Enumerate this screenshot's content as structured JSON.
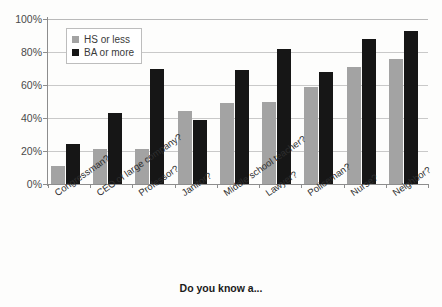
{
  "chart_data": {
    "type": "bar",
    "title": "",
    "subtitle": "",
    "xlabel": "Do you know a...",
    "ylabel": "",
    "ylim": [
      0,
      100
    ],
    "y_unit": "%",
    "grid": true,
    "legend_position": "top-left-inside",
    "categories": [
      "Congressman?",
      "CEO of large company?",
      "Professor?",
      "Janitor?",
      "Middle school teacher?",
      "Lawyer?",
      "Policeman?",
      "Nurse?",
      "Neighbor?"
    ],
    "y_ticks": [
      "0%",
      "20%",
      "40%",
      "60%",
      "80%",
      "100%"
    ],
    "y_tick_values": [
      0,
      20,
      40,
      60,
      80,
      100
    ],
    "series": [
      {
        "name": "HS or less",
        "color": "#a3a3a3",
        "values": [
          11,
          21,
          21,
          44,
          49,
          50,
          59,
          71,
          76
        ]
      },
      {
        "name": "BA or more",
        "color": "#161616",
        "values": [
          24,
          43,
          70,
          39,
          69,
          82,
          68,
          88,
          93
        ]
      }
    ]
  }
}
